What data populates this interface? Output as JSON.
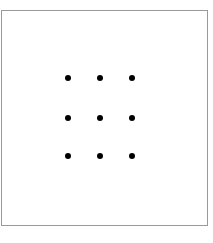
{
  "canvas": {
    "width": 213,
    "height": 243,
    "background_color": "#ffffff"
  },
  "figure": {
    "name": "nine-dot-puzzle-grid",
    "box": {
      "x": 1,
      "y": 10,
      "width": 207,
      "height": 216,
      "border_color": "#9a9a9a",
      "border_width": 1,
      "fill_color": "#ffffff"
    },
    "dot_color": "#000000",
    "dot_diameter": 6,
    "rows": 3,
    "columns": 3,
    "column_centers_x": [
      68,
      100,
      132
    ],
    "row_centers_y": [
      78,
      118,
      156
    ],
    "dots": [
      {
        "id": "dot-r1c1",
        "row": 1,
        "col": 1,
        "cx": 68,
        "cy": 78
      },
      {
        "id": "dot-r1c2",
        "row": 1,
        "col": 2,
        "cx": 100,
        "cy": 78
      },
      {
        "id": "dot-r1c3",
        "row": 1,
        "col": 3,
        "cx": 132,
        "cy": 78
      },
      {
        "id": "dot-r2c1",
        "row": 2,
        "col": 1,
        "cx": 68,
        "cy": 118
      },
      {
        "id": "dot-r2c2",
        "row": 2,
        "col": 2,
        "cx": 100,
        "cy": 118
      },
      {
        "id": "dot-r2c3",
        "row": 2,
        "col": 3,
        "cx": 132,
        "cy": 118
      },
      {
        "id": "dot-r3c1",
        "row": 3,
        "col": 1,
        "cx": 68,
        "cy": 156
      },
      {
        "id": "dot-r3c2",
        "row": 3,
        "col": 2,
        "cx": 100,
        "cy": 156
      },
      {
        "id": "dot-r3c3",
        "row": 3,
        "col": 3,
        "cx": 132,
        "cy": 156
      }
    ]
  }
}
